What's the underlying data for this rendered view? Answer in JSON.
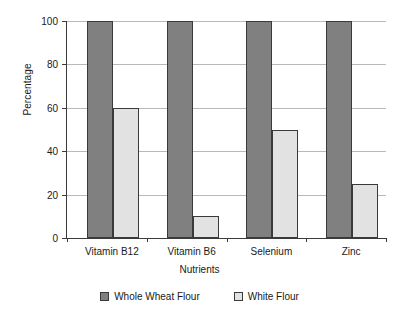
{
  "chart_data": {
    "type": "bar",
    "title": "",
    "xlabel": "Nutrients",
    "ylabel": "Percentage",
    "categories": [
      "Vitamin B12",
      "Vitamin B6",
      "Selenium",
      "Zinc"
    ],
    "series": [
      {
        "name": "Whole Wheat Flour",
        "color": "#808080",
        "values": [
          100,
          100,
          100,
          100
        ]
      },
      {
        "name": "White Flour",
        "color": "#e2e2e2",
        "values": [
          60,
          10,
          50,
          25
        ]
      }
    ],
    "ylim": [
      0,
      100
    ],
    "yticks": [
      0,
      20,
      40,
      60,
      80,
      100
    ],
    "ytick_labels": [
      "0",
      "20",
      "40",
      "60",
      "80",
      "100"
    ],
    "grid": true,
    "legend_position": "bottom"
  }
}
